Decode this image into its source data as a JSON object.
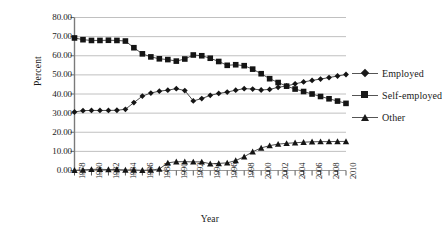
{
  "chart_data": {
    "type": "line",
    "title": "",
    "xlabel": "Year",
    "ylabel": "Percent",
    "ylim": [
      0,
      80
    ],
    "ytick_step": 10,
    "ytick_labels": [
      "0.00",
      "10.00",
      "20.00",
      "30.00",
      "40.00",
      "50.00",
      "60.00",
      "70.00",
      "80.00"
    ],
    "grid": true,
    "legend_position": "right",
    "x": [
      1978,
      1979,
      1980,
      1981,
      1982,
      1983,
      1984,
      1985,
      1986,
      1987,
      1988,
      1989,
      1990,
      1991,
      1992,
      1993,
      1994,
      1995,
      1996,
      1997,
      1998,
      1999,
      2000,
      2001,
      2002,
      2003,
      2004,
      2005,
      2006,
      2007,
      2008,
      2009,
      2010
    ],
    "xtick_labels": [
      "1978",
      "1980",
      "1982",
      "1984",
      "1986",
      "1988",
      "1990",
      "1992",
      "1994",
      "1996",
      "1998",
      "2000",
      "2002",
      "2004",
      "2006",
      "2008",
      "2010"
    ],
    "xtick_step": 2,
    "xlim": [
      1978,
      2010
    ],
    "series": [
      {
        "name": "Employed",
        "marker": "diamond",
        "values": [
          30.6,
          31.3,
          31.4,
          31.4,
          31.4,
          31.5,
          32.0,
          35.5,
          38.9,
          40.5,
          41.5,
          42.0,
          42.8,
          41.8,
          36.4,
          37.6,
          39.3,
          40.3,
          41.0,
          42.0,
          42.8,
          42.6,
          42.1,
          42.4,
          43.5,
          44.2,
          45.3,
          46.3,
          47.1,
          47.8,
          48.6,
          49.4,
          50.2
        ]
      },
      {
        "name": "Self-employed",
        "marker": "square",
        "values": [
          69.3,
          68.4,
          68.0,
          68.0,
          68.1,
          68.0,
          67.7,
          64.2,
          61.0,
          59.4,
          58.4,
          58.0,
          57.2,
          58.3,
          60.4,
          60.0,
          58.7,
          57.0,
          55.0,
          55.3,
          54.8,
          53.0,
          50.6,
          48.0,
          46.0,
          44.1,
          42.6,
          41.3,
          40.0,
          38.7,
          37.5,
          36.3,
          35.1
        ]
      },
      {
        "name": "Other",
        "marker": "triangle",
        "values": [
          0.1,
          0.3,
          0.6,
          0.6,
          0.5,
          0.5,
          0.3,
          0.3,
          0.1,
          0.2,
          0.8,
          4.0,
          4.6,
          4.6,
          4.5,
          4.5,
          3.5,
          3.7,
          4.0,
          5.2,
          7.2,
          9.8,
          11.8,
          13.0,
          13.8,
          14.2,
          14.5,
          14.8,
          15.0,
          15.1,
          15.1,
          15.2,
          15.2
        ]
      }
    ]
  },
  "axes": {
    "y_title": "Percent",
    "x_title": "Year"
  }
}
